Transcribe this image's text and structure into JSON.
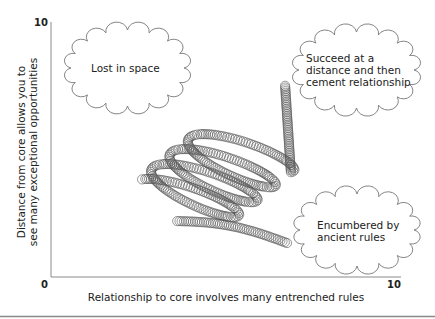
{
  "caption_cut": "",
  "axes": {
    "y_label_line1": "Distance from core allows you to",
    "y_label_line2": "see many exceptional opportunities",
    "x_label": "Relationship to core involves many entrenched rules",
    "y_max_tick": "10",
    "origin_tick": "0",
    "x_max_tick": "10",
    "color": "#8a8a8a"
  },
  "clouds": [
    {
      "id": "lost-in-space",
      "lines": [
        "Lost in space"
      ],
      "box": [
        67,
        26,
        121,
        84
      ]
    },
    {
      "id": "succeed-at-distance",
      "lines": [
        "Succeed at a",
        "distance and then",
        "cement relationship"
      ],
      "box": [
        295,
        28,
        123,
        84
      ]
    },
    {
      "id": "encumbered",
      "lines": [
        "Encumbered by",
        "ancient rules"
      ],
      "box": [
        296,
        190,
        122,
        80
      ]
    }
  ],
  "spiral": {
    "start": [
      287,
      243
    ],
    "end": [
      285,
      84
    ],
    "tube_radius": 4.6,
    "loops": 4,
    "stroke": "#555555"
  },
  "chart_data": {
    "type": "diagram",
    "xlabel": "Relationship to core involves many entrenched rules",
    "ylabel": "Distance from core allows you to see many exceptional opportunities",
    "xlim": [
      0,
      10
    ],
    "ylim": [
      0,
      10
    ],
    "annotations": [
      {
        "text": "Lost in space",
        "x": 2.6,
        "y": 7.8
      },
      {
        "text": "Succeed at a distance and then cement relationship",
        "x": 9.8,
        "y": 7.8
      },
      {
        "text": "Encumbered by ancient rules",
        "x": 9.8,
        "y": 1.3
      }
    ],
    "spiral": {
      "start": [
        6.7,
        1.3
      ],
      "end": [
        6.6,
        7.5
      ],
      "turns": 4
    }
  },
  "footer_rule": true
}
